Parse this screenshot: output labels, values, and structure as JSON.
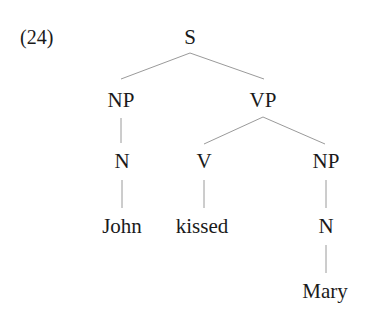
{
  "example_number": "(24)",
  "tree": {
    "nodes": [
      {
        "id": "S",
        "label": "S",
        "x": 190,
        "y": 27
      },
      {
        "id": "NP1",
        "label": "NP",
        "x": 121,
        "y": 90
      },
      {
        "id": "VP",
        "label": "VP",
        "x": 263,
        "y": 90
      },
      {
        "id": "N1",
        "label": "N",
        "x": 122,
        "y": 151
      },
      {
        "id": "V",
        "label": "V",
        "x": 204,
        "y": 151
      },
      {
        "id": "NP2",
        "label": "NP",
        "x": 326,
        "y": 151
      },
      {
        "id": "John",
        "label": "John",
        "x": 122,
        "y": 216
      },
      {
        "id": "kissed",
        "label": "kissed",
        "x": 202,
        "y": 216
      },
      {
        "id": "N2",
        "label": "N",
        "x": 326,
        "y": 216
      },
      {
        "id": "Mary",
        "label": "Mary",
        "x": 325,
        "y": 281
      }
    ],
    "edges": [
      {
        "from": "S",
        "to": "NP1",
        "x1": 190,
        "y1": 53,
        "x2": 121,
        "y2": 79
      },
      {
        "from": "S",
        "to": "VP",
        "x1": 190,
        "y1": 53,
        "x2": 264,
        "y2": 79
      },
      {
        "from": "NP1",
        "to": "N1",
        "x1": 121,
        "y1": 118,
        "x2": 121,
        "y2": 143
      },
      {
        "from": "VP",
        "to": "V",
        "x1": 263,
        "y1": 117,
        "x2": 204,
        "y2": 144
      },
      {
        "from": "VP",
        "to": "NP2",
        "x1": 263,
        "y1": 117,
        "x2": 325,
        "y2": 144
      },
      {
        "from": "N1",
        "to": "John",
        "x1": 122,
        "y1": 180,
        "x2": 122,
        "y2": 208
      },
      {
        "from": "V",
        "to": "kissed",
        "x1": 204,
        "y1": 180,
        "x2": 204,
        "y2": 208
      },
      {
        "from": "NP2",
        "to": "N2",
        "x1": 326,
        "y1": 180,
        "x2": 326,
        "y2": 208
      },
      {
        "from": "N2",
        "to": "Mary",
        "x1": 326,
        "y1": 245,
        "x2": 326,
        "y2": 273
      }
    ]
  },
  "colors": {
    "line": "#9a9a9a",
    "text": "#1a1a1a"
  }
}
